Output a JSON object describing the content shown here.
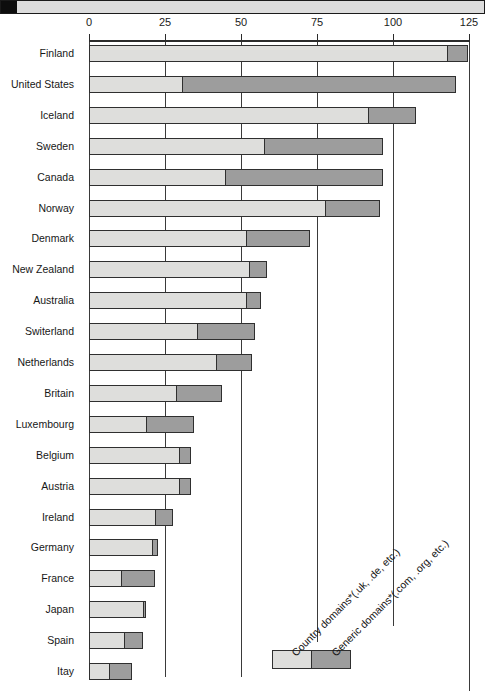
{
  "titlebar": {
    "caption": ""
  },
  "chart_data": {
    "type": "bar",
    "subtype": "stacked-horizontal",
    "title": "",
    "xlabel": "",
    "ylabel": "",
    "xlim": [
      0,
      125
    ],
    "xticks": [
      0,
      25,
      50,
      75,
      100,
      125
    ],
    "xtick_labels": [
      "0",
      "25",
      "50",
      "75",
      "100",
      "125"
    ],
    "grid": true,
    "grid_axis": "x",
    "legend_position": "bottom-right",
    "categories": [
      "Finland",
      "United States",
      "Iceland",
      "Sweden",
      "Canada",
      "Norway",
      "Denmark",
      "New Zealand",
      "Australia",
      "Switerland",
      "Netherlands",
      "Britain",
      "Luxembourg",
      "Belgium",
      "Austria",
      "Ireland",
      "Germany",
      "France",
      "Japan",
      "Spain",
      "Itay"
    ],
    "series": [
      {
        "name": "Country domains* (.uk, .de, etc.)",
        "color": "#dededc",
        "values": [
          118,
          31,
          92,
          58,
          45,
          78,
          52,
          53,
          52,
          36,
          42,
          29,
          19,
          30,
          30,
          22,
          21,
          11,
          18,
          12,
          7
        ]
      },
      {
        "name": "Generic domains* (.com, .org, etc.)",
        "color": "#9d9d9d",
        "values": [
          7,
          90,
          16,
          39,
          52,
          18,
          21,
          6,
          5,
          19,
          12,
          15,
          16,
          4,
          4,
          6,
          2,
          11,
          1,
          6,
          7.5
        ]
      }
    ],
    "totals": [
      125,
      121,
      108,
      97,
      97,
      96,
      73,
      59,
      57,
      55,
      54,
      44,
      35,
      34,
      34,
      28,
      23,
      22,
      19,
      18,
      14.5
    ]
  },
  "legend": {
    "items": [
      {
        "label": "Country domains*(.uk, .de, etc.)",
        "swatch_color": "#dededc"
      },
      {
        "label": "Generic domains*(.com, .org, etc.)",
        "swatch_color": "#9d9d9d"
      }
    ]
  }
}
